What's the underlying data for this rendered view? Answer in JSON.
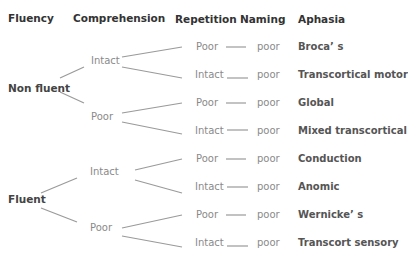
{
  "headers": {
    "fluency": "Fluency",
    "comprehension": "Comprehension",
    "repetition": "Repetition",
    "naming": "Naming",
    "aphasia": "Aphasia"
  },
  "fluency": {
    "non_fluent": "Non fluent",
    "fluent": "Fluent"
  },
  "comprehension": [
    {
      "label": "Intact"
    },
    {
      "label": "Poor"
    },
    {
      "label": "Intact"
    },
    {
      "label": "Poor"
    }
  ],
  "rows": [
    {
      "repetition": "Poor",
      "naming": "poor",
      "aphasia": "Broca’ s"
    },
    {
      "repetition": "Intact",
      "naming": "poor",
      "aphasia": "Transcortical motor"
    },
    {
      "repetition": "Poor",
      "naming": "poor",
      "aphasia": "Global"
    },
    {
      "repetition": "Intact",
      "naming": "poor",
      "aphasia": "Mixed transcortical"
    },
    {
      "repetition": "Poor",
      "naming": "poor",
      "aphasia": "Conduction"
    },
    {
      "repetition": "Intact",
      "naming": "poor",
      "aphasia": "Anomic"
    },
    {
      "repetition": "Poor",
      "naming": "poor",
      "aphasia": "Wernicke’ s"
    },
    {
      "repetition": "Intact",
      "naming": "poor",
      "aphasia": "Transcort sensory"
    }
  ],
  "colors": {
    "lines": "#9a9a9a",
    "header_text": "#333333",
    "level_text": "#8a8a8a",
    "aphasia_text": "#555555"
  }
}
